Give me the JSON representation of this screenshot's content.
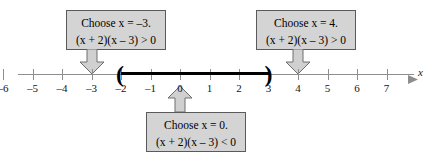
{
  "figure": {
    "type": "number-line-sign-chart",
    "axis_variable": "x",
    "axis_min_tick": -6,
    "axis_max_tick": 7
  },
  "axis": {
    "label": "x",
    "ticks": [
      {
        "value": -6,
        "label": "–6"
      },
      {
        "value": -5,
        "label": "–5"
      },
      {
        "value": -4,
        "label": "–4"
      },
      {
        "value": -3,
        "label": "–3"
      },
      {
        "value": -2,
        "label": "–2"
      },
      {
        "value": -1,
        "label": "–1"
      },
      {
        "value": 0,
        "label": "0"
      },
      {
        "value": 1,
        "label": "1"
      },
      {
        "value": 2,
        "label": "2"
      },
      {
        "value": 3,
        "label": "3"
      },
      {
        "value": 4,
        "label": "4"
      },
      {
        "value": 5,
        "label": "5"
      },
      {
        "value": 6,
        "label": "6"
      },
      {
        "value": 7,
        "label": "7"
      }
    ]
  },
  "interval": {
    "left_bracket": "(",
    "right_bracket": ")",
    "left_value": -2,
    "right_value": 3,
    "endpoints_included": false
  },
  "callouts": {
    "left": {
      "line1": "Choose x = –3.",
      "line2": "(x + 2)(x – 3) > 0",
      "points_to": -3,
      "direction": "down"
    },
    "right": {
      "line1": "Choose x = 4.",
      "line2": "(x + 2)(x – 3) > 0",
      "points_to": 4,
      "direction": "down"
    },
    "middle": {
      "line1": "Choose x = 0.",
      "line2": "(x + 2)(x – 3) < 0",
      "points_to": 0,
      "direction": "up"
    }
  },
  "colors": {
    "box_fill": "#d4d4d4",
    "box_border": "#5a5a5a",
    "axis": "#8e8e8e",
    "interval": "#000000",
    "arrow_fill": "#d0d0d0",
    "arrow_border": "#6e6e6e"
  }
}
